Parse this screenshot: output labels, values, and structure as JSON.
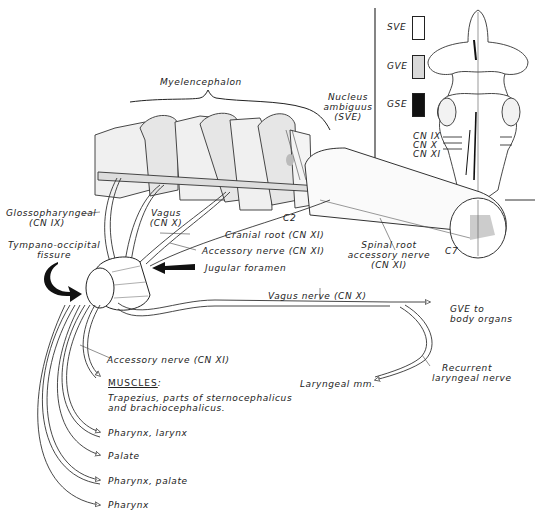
{
  "figure": {
    "title_region": "Myelencephalon",
    "nucleus_label": [
      "Nucleus",
      "ambiguus",
      "(SVE)"
    ],
    "legend": {
      "items": [
        {
          "label": "SVE",
          "fill": "#ffffff",
          "pattern": "blank"
        },
        {
          "label": "GVE",
          "fill": "#d9d9d9",
          "pattern": "stippled"
        },
        {
          "label": "GSE",
          "fill": "#111111",
          "pattern": "solid"
        }
      ]
    },
    "brainstem_inset": {
      "cn_labels": [
        "CN IX",
        "CN X",
        "CN XI"
      ]
    },
    "labels": {
      "glossopharyngeal": [
        "Glossopharyngeal",
        "(CN IX)"
      ],
      "vagus": [
        "Vagus",
        "(CN X)"
      ],
      "c2": "C2",
      "c7": "C7",
      "cranial_root": "Cranial root (CN XI)",
      "accessory_nerve_upper": "Accessory nerve (CN XI)",
      "spinal_root": [
        "Spinal root",
        "accessory nerve",
        "(CN XI)"
      ],
      "tympano_occipital": [
        "Tympano-occipital",
        "fissure"
      ],
      "jugular_foramen": "Jugular foramen",
      "vagus_nerve": "Vagus nerve (CN X)",
      "gve_target": [
        "GVE to",
        "body organs"
      ],
      "recurrent_laryngeal": [
        "Recurrent",
        "laryngeal nerve"
      ],
      "laryngeal_mm": "Laryngeal mm.",
      "accessory_nerve_lower": "Accessory nerve (CN XI)",
      "muscles_heading": "MUSCLES",
      "muscles_colon": ":",
      "muscles_text": [
        "Trapezius, parts of sternocephalicus",
        "and brachiocephalicus."
      ]
    },
    "targets": [
      "Pharynx, larynx",
      "Palate",
      "Pharynx, palate",
      "Pharynx"
    ]
  }
}
